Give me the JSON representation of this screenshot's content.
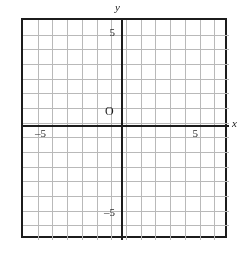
{
  "figure": {
    "kind": "cartesian-coordinate-grid",
    "background_color": "#ffffff",
    "frame_color": "#1c1c1c",
    "grid_line_color": "#b9b9b9",
    "axis_color": "#1c1c1c",
    "label_color": "#1c1c1c"
  },
  "axes": {
    "x_axis_name": "x",
    "y_axis_name": "y",
    "origin_label": "O"
  },
  "tick_labels": {
    "y_positive": "5",
    "y_negative": "–5",
    "x_positive": "5",
    "x_negative": "–5"
  },
  "chart_data": {
    "type": "scatter",
    "title": "",
    "xlabel": "x",
    "ylabel": "y",
    "origin_label": "O",
    "grid": true,
    "legend": null,
    "series": [],
    "x": [],
    "values": [],
    "xlim": [
      -7,
      7
    ],
    "ylim": [
      -8,
      7
    ],
    "xticks": [
      -5,
      5
    ],
    "yticks": [
      -5,
      5
    ],
    "xtick_labels": [
      "–5",
      "5"
    ],
    "ytick_labels": [
      "–5",
      "5"
    ],
    "grid_step": 1,
    "columns": 14,
    "rows": 15,
    "annotations": []
  }
}
